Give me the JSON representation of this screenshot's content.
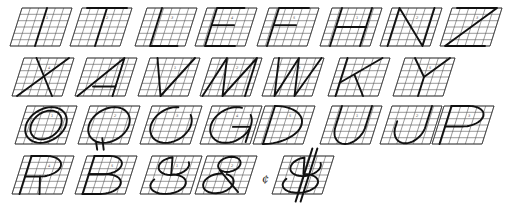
{
  "grid": {
    "rows": 6,
    "cols": 6,
    "slant_px": 10,
    "line_color": "#555555",
    "stroke_color": "#111111"
  },
  "rows": [
    {
      "y": 6,
      "letters": [
        "I",
        "T",
        "L",
        "E",
        "F",
        "H",
        "N",
        "Z"
      ]
    },
    {
      "y": 56,
      "letters": [
        "X",
        "A",
        "V",
        "M",
        "W",
        "K",
        "Y"
      ]
    },
    {
      "y": 104,
      "letters": [
        "O",
        "Q",
        "C",
        "G",
        "D",
        "U",
        "J",
        "P"
      ]
    },
    {
      "y": 154,
      "letters": [
        "R",
        "B",
        "S",
        "&",
        "$"
      ]
    }
  ],
  "cells": [
    {
      "id": "I",
      "x": 10,
      "y": 6
    },
    {
      "id": "T",
      "x": 70,
      "y": 6
    },
    {
      "id": "L",
      "x": 135,
      "y": 6
    },
    {
      "id": "E",
      "x": 195,
      "y": 6
    },
    {
      "id": "F",
      "x": 257,
      "y": 6
    },
    {
      "id": "H",
      "x": 320,
      "y": 6
    },
    {
      "id": "N",
      "x": 380,
      "y": 6
    },
    {
      "id": "Z",
      "x": 440,
      "y": 6
    },
    {
      "id": "X",
      "x": 12,
      "y": 56
    },
    {
      "id": "A",
      "x": 75,
      "y": 56
    },
    {
      "id": "V",
      "x": 138,
      "y": 56
    },
    {
      "id": "M",
      "x": 200,
      "y": 56
    },
    {
      "id": "W",
      "x": 262,
      "y": 56
    },
    {
      "id": "K",
      "x": 328,
      "y": 56
    },
    {
      "id": "Y",
      "x": 393,
      "y": 56
    },
    {
      "id": "O",
      "x": 15,
      "y": 104
    },
    {
      "id": "Q",
      "x": 78,
      "y": 104
    },
    {
      "id": "C",
      "x": 140,
      "y": 104
    },
    {
      "id": "G",
      "x": 200,
      "y": 104
    },
    {
      "id": "D",
      "x": 253,
      "y": 104
    },
    {
      "id": "U",
      "x": 320,
      "y": 104
    },
    {
      "id": "J",
      "x": 380,
      "y": 104
    },
    {
      "id": "P",
      "x": 432,
      "y": 104
    },
    {
      "id": "R",
      "x": 12,
      "y": 154
    },
    {
      "id": "B",
      "x": 75,
      "y": 154
    },
    {
      "id": "S",
      "x": 140,
      "y": 154
    },
    {
      "id": "&",
      "x": 195,
      "y": 154
    },
    {
      "id": "$",
      "x": 272,
      "y": 154
    }
  ],
  "extra_glyph": {
    "text": "¢",
    "x": 262,
    "y": 176
  },
  "annotation_marks": [
    "1",
    "2",
    "3",
    "4",
    "5"
  ]
}
